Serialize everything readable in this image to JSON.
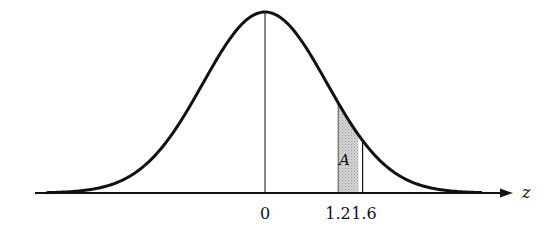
{
  "figure": {
    "axis_label": "z",
    "tick_labels": [
      "0",
      "1.2",
      "1.6"
    ],
    "area_label": "A",
    "colors": {
      "curve": "#111111",
      "shade": "#c8c8c8",
      "axis": "#111111"
    }
  },
  "chart_data": {
    "type": "area",
    "title": "",
    "xlabel": "z",
    "ylabel": "",
    "distribution": "standard normal",
    "ticks": [
      0,
      1.2,
      1.6
    ],
    "shaded_region": {
      "from": 1.2,
      "to": 1.6,
      "label": "A"
    },
    "grid": false,
    "legend": false
  }
}
